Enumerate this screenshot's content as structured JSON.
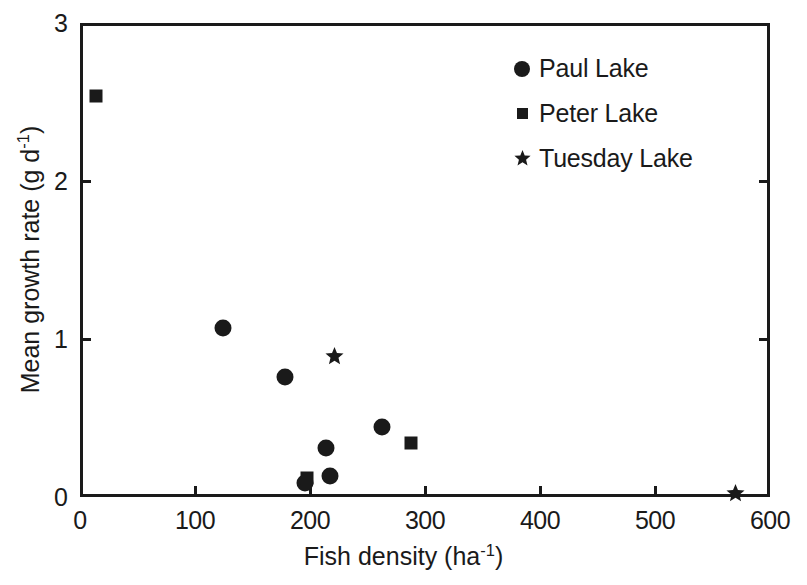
{
  "chart_data": {
    "type": "scatter",
    "title": "",
    "xlabel": "Fish density (ha⁻¹)",
    "ylabel": "Mean growth rate (g d⁻¹)",
    "xlabel_parts": {
      "text": "Fish density (ha",
      "sup": "-1",
      "tail": ")"
    },
    "ylabel_parts": {
      "text": "Mean growth rate (g d",
      "sup": "-1",
      "tail": ")"
    },
    "xlim": [
      0,
      600
    ],
    "ylim": [
      0,
      3
    ],
    "xticks": [
      0,
      100,
      200,
      300,
      400,
      500,
      600
    ],
    "yticks": [
      0,
      1,
      2,
      3
    ],
    "xticklabels": [
      "0",
      "100",
      "200",
      "300",
      "400",
      "500",
      "600"
    ],
    "yticklabels": [
      "0",
      "1",
      "2",
      "3"
    ],
    "grid": false,
    "legend_position": "top-right",
    "marker_color": "#1a1a1a",
    "frame_color": "#1a1a1a",
    "background": "#ffffff",
    "series": [
      {
        "name": "Paul Lake",
        "marker": "circle",
        "points": [
          {
            "x": 124,
            "y": 1.07
          },
          {
            "x": 178,
            "y": 0.76
          },
          {
            "x": 196,
            "y": 0.09
          },
          {
            "x": 214,
            "y": 0.31
          },
          {
            "x": 217,
            "y": 0.13
          },
          {
            "x": 263,
            "y": 0.44
          }
        ]
      },
      {
        "name": "Peter Lake",
        "marker": "square",
        "points": [
          {
            "x": 14,
            "y": 2.54
          },
          {
            "x": 197,
            "y": 0.12
          },
          {
            "x": 288,
            "y": 0.34
          }
        ]
      },
      {
        "name": "Tuesday Lake",
        "marker": "star",
        "points": [
          {
            "x": 213,
            "y": 0.95
          },
          {
            "x": 562,
            "y": 0.08
          }
        ]
      }
    ]
  },
  "legend": {
    "entries": [
      {
        "label": "Paul Lake",
        "marker": "circle"
      },
      {
        "label": "Peter Lake",
        "marker": "square"
      },
      {
        "label": "Tuesday Lake",
        "marker": "star"
      }
    ]
  }
}
